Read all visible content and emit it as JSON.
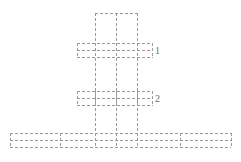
{
  "figure": {
    "type": "structural-schematic",
    "title": "",
    "background_color": "#ffffff",
    "line_color": "#9a9a9a",
    "line_style": "dashed",
    "line_width": 1,
    "dash_pattern": "3 2",
    "width": 241,
    "height": 162
  },
  "labels": [
    {
      "id": "1",
      "text": "1",
      "x": 157,
      "y": 51,
      "color": "#6e6e6e"
    },
    {
      "id": "2",
      "text": "2",
      "x": 157,
      "y": 99,
      "color": "#6e6e6e"
    }
  ],
  "geometry": {
    "column": {
      "name": "vertical-column",
      "x_lines": [
        95,
        116,
        137
      ],
      "y_top": 13,
      "y_bottom": 147
    },
    "bands": [
      {
        "name": "upper-flange-band",
        "label_ref": "1",
        "x_left": 77,
        "x_right": 152,
        "y_lines": [
          43,
          50,
          57
        ]
      },
      {
        "name": "lower-flange-band",
        "label_ref": "2",
        "x_left": 77,
        "x_right": 152,
        "y_lines": [
          91,
          98,
          105
        ]
      },
      {
        "name": "base-slab-band",
        "label_ref": "",
        "x_left": 10,
        "x_right": 231,
        "y_lines": [
          133,
          140,
          147
        ]
      }
    ],
    "band_verticals": {
      "upper": [
        77,
        95,
        116,
        137,
        152
      ],
      "lower": [
        77,
        95,
        116,
        137,
        152
      ],
      "base": [
        10,
        60,
        95,
        116,
        137,
        180,
        231
      ]
    }
  }
}
